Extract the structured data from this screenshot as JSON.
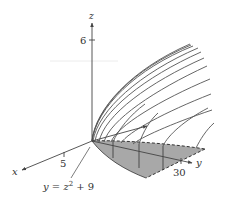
{
  "figure": {
    "axes": {
      "x": {
        "label": "x",
        "tick_label": "5"
      },
      "y": {
        "label": "y",
        "tick_label": "30"
      },
      "z": {
        "label": "z",
        "tick_label": "6"
      }
    },
    "annotation": {
      "curve_label_lhs": "y = z",
      "curve_label_exp": "2",
      "curve_label_rhs": " + 9"
    },
    "colors": {
      "axis": "#444444",
      "curve": "#555555",
      "shaded_region": "#a9a9a9",
      "dashed_edge": "#333333",
      "guide_line": "#e8e8e8"
    }
  }
}
